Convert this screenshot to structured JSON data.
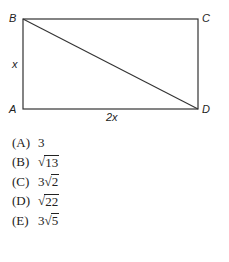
{
  "figure": {
    "vertices": {
      "A": "A",
      "B": "B",
      "C": "C",
      "D": "D"
    },
    "side_labels": {
      "left": "x",
      "bottom": "2x"
    },
    "diagonal": "BD"
  },
  "choices": [
    {
      "letter": "(A)",
      "coef": "3",
      "radicand": ""
    },
    {
      "letter": "(B)",
      "coef": "",
      "radicand": "13"
    },
    {
      "letter": "(C)",
      "coef": "3",
      "radicand": "2"
    },
    {
      "letter": "(D)",
      "coef": "",
      "radicand": "22"
    },
    {
      "letter": "(E)",
      "coef": "3",
      "radicand": "5"
    }
  ],
  "sqrt_symbol": "√"
}
